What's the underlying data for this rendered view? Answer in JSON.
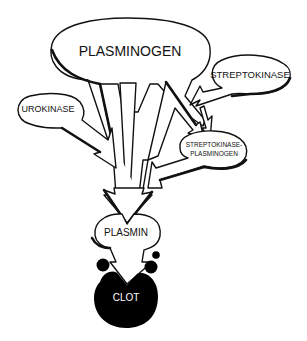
{
  "diagram": {
    "title": "",
    "nodes": [
      {
        "id": "plasminogen",
        "label": "PLASMINOGEN"
      },
      {
        "id": "streptokinase",
        "label": "STREPTOKINASE"
      },
      {
        "id": "urokinase",
        "label": "UROKINASE"
      },
      {
        "id": "sk_plasminogen",
        "label_line1": "STREPTOKINASE-",
        "label_line2": "PLASMINOGEN"
      },
      {
        "id": "plasmin",
        "label": "PLASMIN"
      },
      {
        "id": "clot",
        "label": "CLOT"
      }
    ],
    "edges": [
      {
        "from": "plasminogen",
        "to": "plasmin"
      },
      {
        "from": "plasminogen",
        "to": "sk_plasminogen"
      },
      {
        "from": "streptokinase",
        "to": "sk_plasminogen"
      },
      {
        "from": "urokinase",
        "to": "plasmin"
      },
      {
        "from": "sk_plasminogen",
        "to": "plasmin"
      },
      {
        "from": "plasmin",
        "to": "clot"
      }
    ],
    "colors": {
      "ink": "#111111",
      "background": "#ffffff",
      "clot_fill": "#000000",
      "clot_text": "#ffffff"
    }
  }
}
